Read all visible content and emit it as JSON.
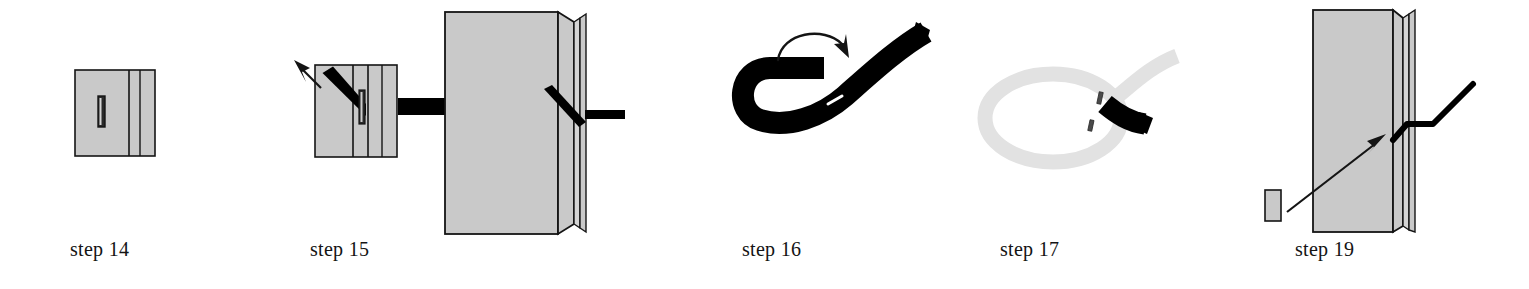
{
  "document": {
    "kind": "assembly-instruction-diagram",
    "background_color": "#ffffff",
    "ink_color": "#141414",
    "panel_fill_color": "#c9c9c9",
    "ghost_color": "#e2e2e2",
    "strap_color": "#000000"
  },
  "panels": [
    {
      "id": "step-14",
      "caption": "step 14",
      "figure_name": "flat-panel-with-slot",
      "description_parts": [
        "rectangular gray panel",
        "two vertical seam lines on right side",
        "small dark vertical slot left of center"
      ]
    },
    {
      "id": "step-15",
      "caption": "step 15",
      "figure_name": "panel-with-strap-insertion",
      "description_parts": [
        "rectangular gray panel",
        "diagonal black strap entering slot from upper left",
        "arrow pointing up-left",
        "horizontal black strap exiting to the right"
      ]
    },
    {
      "id": "step-16-detail",
      "caption": "",
      "figure_name": "enlarged-panel-perspective-detail",
      "description_parts": [
        "enlarged perspective view of panel edge",
        "black strap passing through the slot",
        "black strap tail extending right"
      ]
    },
    {
      "id": "step-16",
      "caption": "step 16",
      "figure_name": "strap-s-curve-with-rotation-arrow",
      "description_parts": [
        "thick black strap bent into an S curve",
        "curved rotation arrow above pointing clockwise",
        "white slit marking on strap"
      ]
    },
    {
      "id": "step-17",
      "caption": "step 17",
      "figure_name": "strap-loop-through-buckle",
      "description_parts": [
        "light gray ghosted loop of strap",
        "black strap end threaded through slot at right"
      ]
    },
    {
      "id": "step-19",
      "caption": "step 19",
      "figure_name": "panel-perspective-with-insert-arrow",
      "description_parts": [
        "perspective gray panel",
        "bent black strap crossing the right edge",
        "small detached gray block at lower left",
        "long arrow pointing from block toward panel"
      ]
    }
  ]
}
